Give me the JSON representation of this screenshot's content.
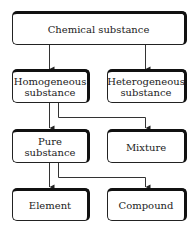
{
  "diagram": {
    "type": "classification-tree",
    "nodes": {
      "chemical_substance": {
        "label": "Chemical substance"
      },
      "homogeneous": {
        "line1": "Homogeneous",
        "line2": "substance"
      },
      "heterogeneous": {
        "line1": "Heterogeneous",
        "line2": "substance"
      },
      "pure_substance": {
        "line1": "Pure",
        "line2": "substance"
      },
      "mixture": {
        "label": "Mixture"
      },
      "element": {
        "label": "Element"
      },
      "compound": {
        "label": "Compound"
      }
    },
    "edges": [
      {
        "from": "Chemical substance",
        "to": "Homogeneous substance"
      },
      {
        "from": "Chemical substance",
        "to": "Heterogeneous substance"
      },
      {
        "from": "Homogeneous substance",
        "to": "Pure substance"
      },
      {
        "from": "Homogeneous substance",
        "to": "Mixture"
      },
      {
        "from": "Pure substance",
        "to": "Element"
      },
      {
        "from": "Pure substance",
        "to": "Compound"
      }
    ],
    "colors": {
      "line": "#222222",
      "background": "#ffffff"
    }
  }
}
